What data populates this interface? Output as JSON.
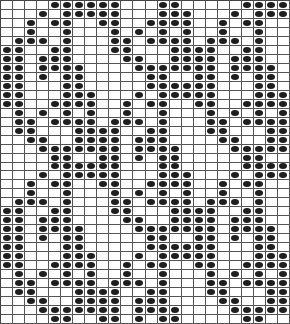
{
  "chart": {
    "type": "stitch-pattern-grid",
    "columns": 24,
    "rows": 36,
    "pattern_repeat_rows": 18,
    "repeats": 2,
    "colors": {
      "background": "#ffffff",
      "grid_line": "#555555",
      "filled_dot": "#1e1e1e"
    },
    "symbol": "filled-dot",
    "pattern_rows_filled_columns": [
      [
        4,
        5,
        6,
        7,
        8,
        9,
        13,
        14,
        20,
        21,
        22,
        23
      ],
      [
        3,
        5,
        6,
        7,
        8,
        9,
        13,
        14,
        15,
        19,
        21,
        22,
        23
      ],
      [
        2,
        4,
        5,
        8,
        9,
        12,
        13,
        14,
        15,
        18,
        20,
        21
      ],
      [
        2,
        5,
        9,
        11,
        13,
        15,
        18,
        21
      ],
      [
        1,
        2,
        3,
        5,
        9,
        10,
        12,
        13,
        14,
        15,
        17,
        18,
        19,
        21
      ],
      [
        0,
        1,
        4,
        5,
        9,
        10,
        14,
        15,
        16,
        17,
        20,
        21
      ],
      [
        0,
        1,
        3,
        4,
        5,
        10,
        11,
        14,
        15,
        16,
        17,
        19,
        20,
        21
      ],
      [
        0,
        1,
        3,
        4,
        5,
        6,
        11,
        12,
        13,
        14,
        15,
        16,
        17,
        19,
        20,
        21,
        22
      ],
      [
        0,
        1,
        3,
        5,
        6,
        12,
        13,
        16,
        17,
        19,
        21,
        22
      ],
      [
        0,
        1,
        5,
        6,
        12,
        13,
        14,
        15,
        16,
        17,
        21,
        22
      ],
      [
        0,
        1,
        5,
        6,
        7,
        11,
        13,
        14,
        15,
        16,
        17,
        21,
        22,
        23
      ],
      [
        0,
        1,
        4,
        5,
        6,
        7,
        10,
        12,
        13,
        16,
        17,
        20,
        21,
        22,
        23
      ],
      [
        1,
        3,
        5,
        7,
        10,
        13,
        17,
        19,
        21,
        23
      ],
      [
        1,
        2,
        4,
        5,
        6,
        7,
        9,
        10,
        11,
        13,
        17,
        18,
        20,
        21,
        22,
        23
      ],
      [
        1,
        2,
        6,
        7,
        8,
        9,
        12,
        13,
        17,
        18,
        22,
        23
      ],
      [
        2,
        3,
        6,
        7,
        8,
        9,
        11,
        12,
        13,
        18,
        19,
        22,
        23
      ],
      [
        3,
        4,
        5,
        6,
        7,
        8,
        9,
        11,
        12,
        13,
        14,
        19,
        20,
        21,
        22,
        23
      ],
      [
        4,
        5,
        8,
        9,
        11,
        13,
        14,
        20,
        21
      ]
    ]
  }
}
